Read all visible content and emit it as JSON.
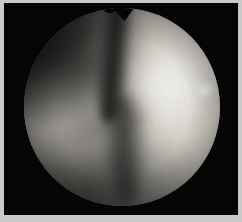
{
  "document": {
    "title": "Endoscopic Field Image",
    "kind": "medical-endoscopic-photograph"
  },
  "viewer": {
    "width_px": 242,
    "height_px": 222,
    "frame_border_color": "#c9c9c7",
    "matte_color": "#050505"
  },
  "scope_field": {
    "shape": "circle",
    "center_x_px": 118,
    "center_y_px": 107,
    "radius_px": 98,
    "vignette": "strong",
    "grain": "heavy"
  },
  "scene": {
    "modality": "arthroscopy",
    "color_mode": "grayscale",
    "regions": [
      {
        "name": "bright-convex-body",
        "position": "right",
        "luminance": "bright",
        "color": "#e8e6e0"
      },
      {
        "name": "central-groove",
        "position": "center",
        "luminance": "dark",
        "color": "#101010"
      },
      {
        "name": "left-tissue-mass",
        "position": "left",
        "luminance": "mid-gray",
        "color": "#b0ada6"
      },
      {
        "name": "upper-left-shadow",
        "position": "upper-left",
        "luminance": "very-dark",
        "color": "#121212"
      },
      {
        "name": "lower-shadow",
        "position": "bottom",
        "luminance": "dark",
        "color": "#3a3a38"
      }
    ],
    "highlights": [
      {
        "name": "right-rim-specular",
        "color": "#ffffff"
      },
      {
        "name": "body-diffuse-highlight",
        "color": "#fffffc"
      }
    ],
    "features": [
      {
        "name": "top-notch",
        "description": "V-shaped notch at top of circular field"
      },
      {
        "name": "vertical-crevice",
        "description": "dark groove running top to bottom through center"
      },
      {
        "name": "crease-band",
        "description": "soft diagonal crease at lower left"
      }
    ]
  }
}
